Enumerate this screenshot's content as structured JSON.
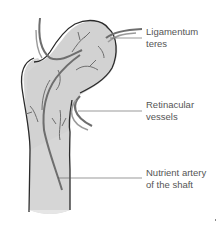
{
  "labels": [
    {
      "id": "ligamentum-teres",
      "line1": "Ligamentum",
      "line2": "teres"
    },
    {
      "id": "retinacular-vessels",
      "line1": "Retinacular",
      "line2": "vessels"
    },
    {
      "id": "nutrient-artery",
      "line1": "Nutrient artery",
      "line2": "of the shaft"
    }
  ],
  "colors": {
    "bone_fill": "#d4d4d4",
    "bone_outline": "#2a2a2a",
    "vessel": "#6e6e6e",
    "vessel_light": "#9a9a9a",
    "leader_line": "#555555",
    "text": "#555555"
  }
}
